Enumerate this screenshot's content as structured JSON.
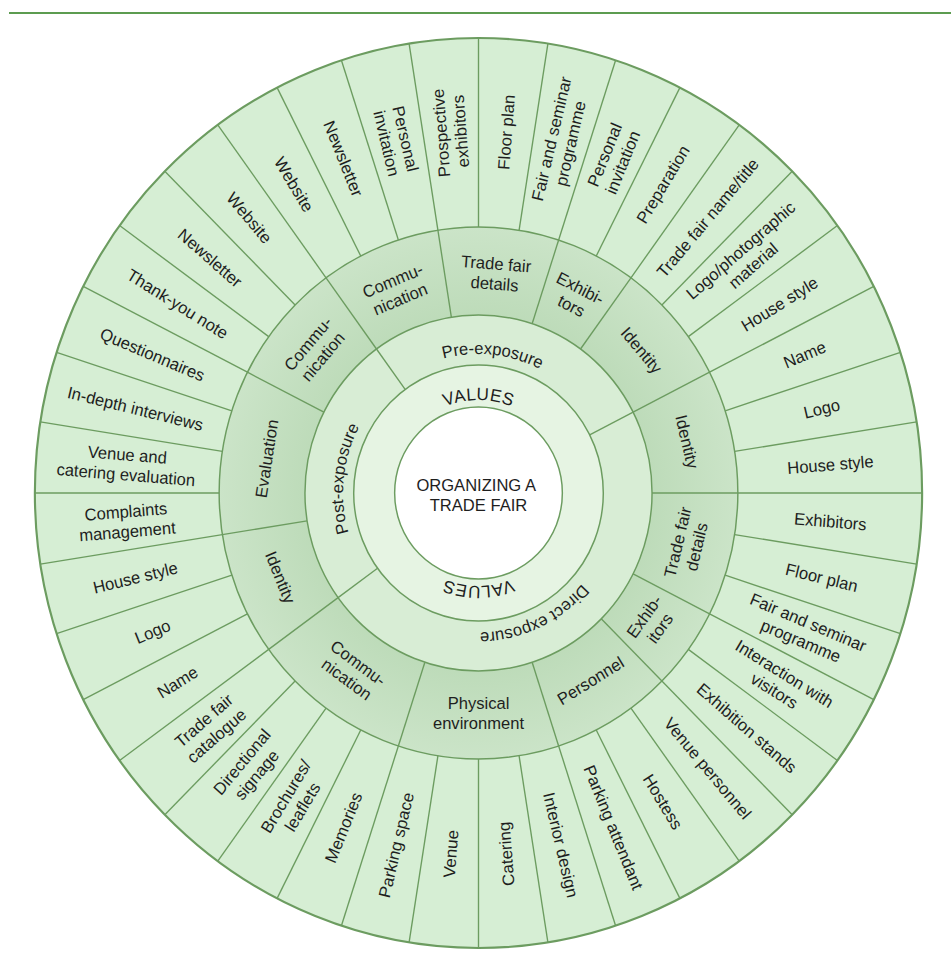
{
  "palette": {
    "rule": "#5c9c50",
    "outer_ring": "#d6eed4",
    "category_ring_inner": "#bddbb9",
    "category_ring_outer": "#cbe4c8",
    "phase_ring": "#d8edd5",
    "values_ring": "#e6f4e3",
    "center": "#ffffff",
    "lines": "#6c9c60"
  },
  "diagram": {
    "title_lines": [
      "ORGANIZING A",
      "TRADE FAIR"
    ],
    "values_top": "VALUES",
    "values_bottom": "VALUES",
    "phases": [
      {
        "name": "Pre-exposure",
        "categories": [
          {
            "name_lines": [
              "Commu-",
              "nication"
            ],
            "items": [
              [
                "Website"
              ],
              [
                "Newsletter"
              ],
              [
                "Personal",
                "invitation"
              ]
            ]
          },
          {
            "name_lines": [
              "Trade fair",
              "details"
            ],
            "items": [
              [
                "Prospective",
                "exhibitors"
              ],
              [
                "Floor plan"
              ],
              [
                "Fair and seminar",
                "programme"
              ]
            ]
          },
          {
            "name_lines": [
              "Exhibi-",
              "tors"
            ],
            "items": [
              [
                "Personal",
                "invitation"
              ],
              [
                "Preparation"
              ]
            ]
          },
          {
            "name_lines": [
              "Identity"
            ],
            "items": [
              [
                "Trade fair name/title"
              ],
              [
                "Logo/photographic",
                "material"
              ],
              [
                "House style"
              ]
            ]
          }
        ]
      },
      {
        "name": "Direct exposure",
        "categories": [
          {
            "name_lines": [
              "Identity"
            ],
            "items": [
              [
                "Name"
              ],
              [
                "Logo"
              ],
              [
                "House style"
              ]
            ]
          },
          {
            "name_lines": [
              "Trade fair",
              "details"
            ],
            "items": [
              [
                "Exhibitors"
              ],
              [
                "Floor plan"
              ],
              [
                "Fair and seminar",
                "programme"
              ]
            ]
          },
          {
            "name_lines": [
              "Exhib-",
              "itors"
            ],
            "items": [
              [
                "Interaction with",
                "visitors"
              ],
              [
                "Exhibition stands"
              ]
            ]
          },
          {
            "name_lines": [
              "Personnel"
            ],
            "items": [
              [
                "Venue personnel"
              ],
              [
                "Hostess"
              ],
              [
                "Parking attendant"
              ]
            ]
          },
          {
            "name_lines": [
              "Physical",
              "environment"
            ],
            "items": [
              [
                "Interior design"
              ],
              [
                "Catering"
              ],
              [
                "Venue"
              ],
              [
                "Parking space"
              ]
            ]
          },
          {
            "name_lines": [
              "Commu-",
              "nication"
            ],
            "items": [
              [
                "Memories"
              ],
              [
                "Brochures/",
                "leaflets"
              ],
              [
                "Directional",
                "signage"
              ],
              [
                "Trade fair",
                "catalogue"
              ]
            ]
          }
        ]
      },
      {
        "name": "Post-exposure",
        "categories": [
          {
            "name_lines": [
              "Identity"
            ],
            "items": [
              [
                "Name"
              ],
              [
                "Logo"
              ],
              [
                "House style"
              ]
            ]
          },
          {
            "name_lines": [
              "Evaluation"
            ],
            "items": [
              [
                "Complaints",
                "management"
              ],
              [
                "Venue and",
                "catering evaluation"
              ],
              [
                "In-depth interviews"
              ],
              [
                "Questionnaires"
              ]
            ]
          },
          {
            "name_lines": [
              "Commu-",
              "nication"
            ],
            "items": [
              [
                "Thank-you note"
              ],
              [
                "Newsletter"
              ],
              [
                "Website"
              ]
            ]
          }
        ]
      }
    ]
  }
}
